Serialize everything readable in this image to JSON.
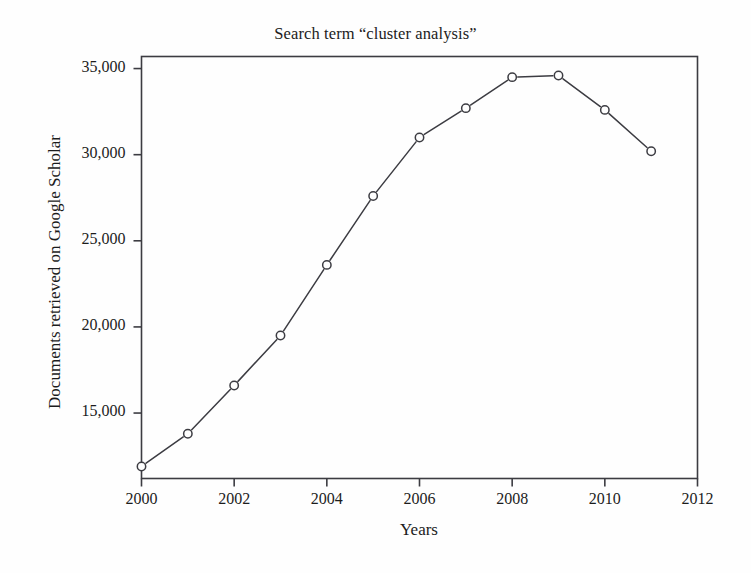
{
  "chart_data": {
    "type": "line",
    "title": "Search term “cluster analysis”",
    "xlabel": "Years",
    "ylabel": "Documents retrieved on Google Scholar",
    "x": [
      2000,
      2001,
      2002,
      2003,
      2004,
      2005,
      2006,
      2007,
      2008,
      2009,
      2010,
      2011
    ],
    "values": [
      11900,
      13800,
      16600,
      19500,
      23600,
      27600,
      31000,
      32700,
      34500,
      34600,
      32600,
      30200
    ],
    "series": [
      {
        "name": "Documents retrieved on Google Scholar",
        "values": [
          11900,
          13800,
          16600,
          19500,
          23600,
          27600,
          31000,
          32700,
          34500,
          34600,
          32600,
          30200
        ]
      }
    ],
    "xlim": [
      2000,
      2012
    ],
    "ylim": [
      11200,
      35700
    ],
    "xticks": [
      2000,
      2002,
      2004,
      2006,
      2008,
      2010,
      2012
    ],
    "xtick_labels": [
      "2000",
      "2002",
      "2004",
      "2006",
      "2008",
      "2010",
      "2012"
    ],
    "yticks": [
      15000,
      20000,
      25000,
      30000,
      35000
    ],
    "ytick_labels": [
      "15,000",
      "20,000",
      "25,000",
      "30,000",
      "35,000"
    ],
    "grid": false,
    "legend": false,
    "marker": "open-circle",
    "line_color": "#3c3c42",
    "marker_color": "#3c3c42",
    "axis_color": "#3c3c42",
    "background_color": "#fefefe"
  }
}
